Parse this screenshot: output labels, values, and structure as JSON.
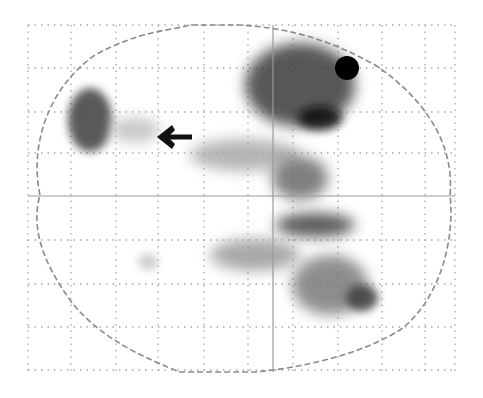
{
  "figure": {
    "background": "#ffffff",
    "grid": {
      "color": "#8a8a8a",
      "v_lines": [
        28,
        71,
        116,
        158,
        204,
        248,
        293,
        338,
        382,
        425,
        455
      ],
      "h_lines": [
        25,
        68,
        112,
        153,
        240,
        284,
        327,
        370
      ]
    },
    "crosshair": {
      "x": 273,
      "y": 196,
      "color": "#9a9a9a"
    },
    "outline_color": "#8a8a8a",
    "marker_dot": {
      "cx": 347,
      "cy": 68,
      "r": 12,
      "color": "#000000"
    },
    "arrow": {
      "direction": "left",
      "tip_x": 158,
      "tip_y": 137,
      "color": "#111111"
    },
    "activations": [
      {
        "name": "left-frontal-cluster",
        "cx": 90,
        "cy": 120,
        "rx": 22,
        "ry": 32,
        "shade": "#3d3d3d"
      },
      {
        "name": "left-frontal-faint",
        "cx": 135,
        "cy": 130,
        "rx": 25,
        "ry": 12,
        "shade": "#bdbdbd"
      },
      {
        "name": "right-frontal-large",
        "cx": 300,
        "cy": 85,
        "rx": 55,
        "ry": 42,
        "shade": "#3a3a3a"
      },
      {
        "name": "right-frontal-core",
        "cx": 320,
        "cy": 118,
        "rx": 22,
        "ry": 12,
        "shade": "#111111"
      },
      {
        "name": "central-band",
        "cx": 245,
        "cy": 155,
        "rx": 55,
        "ry": 16,
        "shade": "#a8a8a8"
      },
      {
        "name": "central-cluster",
        "cx": 300,
        "cy": 178,
        "rx": 28,
        "ry": 22,
        "shade": "#6a6a6a"
      },
      {
        "name": "posterior-band",
        "cx": 315,
        "cy": 225,
        "rx": 40,
        "ry": 12,
        "shade": "#3e3e3e"
      },
      {
        "name": "posterior-left-band",
        "cx": 255,
        "cy": 255,
        "rx": 45,
        "ry": 16,
        "shade": "#9a9a9a"
      },
      {
        "name": "posterior-cluster",
        "cx": 330,
        "cy": 285,
        "rx": 38,
        "ry": 30,
        "shade": "#7a7a7a"
      },
      {
        "name": "posterior-core",
        "cx": 362,
        "cy": 298,
        "rx": 16,
        "ry": 13,
        "shade": "#3a3a3a"
      },
      {
        "name": "small-left-spot",
        "cx": 148,
        "cy": 262,
        "rx": 10,
        "ry": 8,
        "shade": "#c4c4c4"
      }
    ]
  }
}
